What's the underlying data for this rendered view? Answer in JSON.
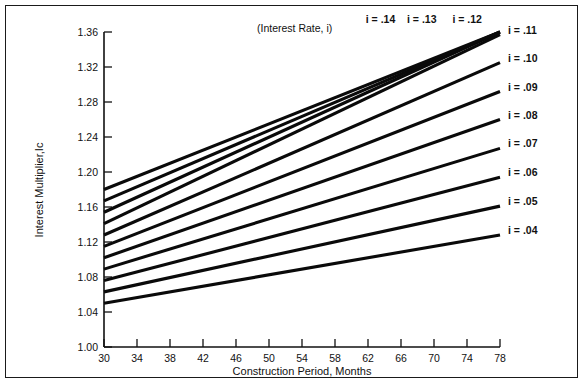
{
  "figure": {
    "title": "",
    "note": "(Interest Rate, i)",
    "background": "#ffffff",
    "line_color": "#0a0a0a",
    "axis_color": "#111111",
    "border_color": "#1a1a1a"
  },
  "axes": {
    "x": {
      "label": "Construction Period, Months",
      "ticks": [
        30,
        34,
        38,
        42,
        46,
        50,
        54,
        58,
        62,
        66,
        70,
        74,
        78
      ],
      "tick_labels": [
        "30",
        "34",
        "38",
        "42",
        "46",
        "50",
        "54",
        "58",
        "62",
        "66",
        "70",
        "74",
        "78"
      ],
      "min": 30,
      "max": 78
    },
    "y": {
      "label": "Interest Multiplier,Ic",
      "ticks": [
        1.0,
        1.04,
        1.08,
        1.12,
        1.16,
        1.2,
        1.24,
        1.28,
        1.32,
        1.36
      ],
      "tick_labels": [
        "1.00",
        "1.04",
        "1.08",
        "1.12",
        "1.16",
        "1.20",
        "1.24",
        "1.28",
        "1.32",
        "1.36"
      ],
      "min": 1.0,
      "max": 1.36
    }
  },
  "chart_data": {
    "type": "line",
    "title": "",
    "xlabel": "Construction Period, Months",
    "ylabel": "Interest Multiplier,Ic",
    "xlim": [
      30,
      78
    ],
    "ylim": [
      1.0,
      1.36
    ],
    "grid": false,
    "legend": "inline-right-end-labels",
    "annotations": [
      "(Interest Rate, i)"
    ],
    "x": [
      30,
      78
    ],
    "series": [
      {
        "name": "i = .04",
        "label": "i = .04",
        "values": [
          1.05,
          1.128
        ],
        "label_x": 78,
        "label_y": 1.128
      },
      {
        "name": "i = .05",
        "label": "i = .05",
        "values": [
          1.063,
          1.161
        ],
        "label_x": 78,
        "label_y": 1.161
      },
      {
        "name": "i = .06",
        "label": "i = .06",
        "values": [
          1.076,
          1.194
        ],
        "label_x": 78,
        "label_y": 1.194
      },
      {
        "name": "i = .07",
        "label": "i = .07",
        "values": [
          1.089,
          1.227
        ],
        "label_x": 78,
        "label_y": 1.227
      },
      {
        "name": "i = .08",
        "label": "i = .08",
        "values": [
          1.102,
          1.26
        ],
        "label_x": 78,
        "label_y": 1.26
      },
      {
        "name": "i = .09",
        "label": "i = .09",
        "values": [
          1.115,
          1.292
        ],
        "label_x": 78,
        "label_y": 1.292
      },
      {
        "name": "i = .10",
        "label": "i = .10",
        "values": [
          1.128,
          1.325
        ],
        "label_x": 78,
        "label_y": 1.325
      },
      {
        "name": "i = .11",
        "label": "i = .11",
        "values": [
          1.141,
          1.357
        ],
        "label_x": 78,
        "label_y": 1.357
      },
      {
        "name": "i = .12",
        "label": "i = .12",
        "values": [
          1.154,
          1.36
        ],
        "label_x": 71.5,
        "label_y": 1.36
      },
      {
        "name": "i = .13",
        "label": "i = .13",
        "values": [
          1.167,
          1.36
        ],
        "label_x": 66.0,
        "label_y": 1.36
      },
      {
        "name": "i = .14",
        "label": "i = .14",
        "values": [
          1.18,
          1.36
        ],
        "label_x": 61.0,
        "label_y": 1.36
      }
    ]
  }
}
